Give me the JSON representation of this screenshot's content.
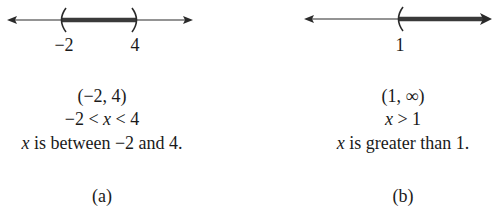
{
  "figures": [
    {
      "id": "a",
      "caption": "(a)",
      "number_line": {
        "type": "bounded-open",
        "left_endpoint": {
          "value": "−2",
          "symbol": "("
        },
        "right_endpoint": {
          "value": "4",
          "symbol": ")"
        },
        "shaded": "between"
      },
      "interval_notation": "(−2, 4)",
      "inequality": {
        "left": "−2 < ",
        "var": "x",
        "right": " < 4"
      },
      "description": {
        "var": "x",
        "text": " is between −2 and 4."
      }
    },
    {
      "id": "b",
      "caption": "(b)",
      "number_line": {
        "type": "unbounded-open",
        "left_endpoint": {
          "value": "1",
          "symbol": "("
        },
        "shaded": "right-to-infinity"
      },
      "interval_notation": "(1, ∞)",
      "inequality": {
        "left": "",
        "var": "x",
        "right": " > 1"
      },
      "description": {
        "var": "x",
        "text": " is greater than 1."
      }
    }
  ],
  "colors": {
    "line": "#2a2a2a",
    "shade": "#3a3a3a",
    "text": "#1a1a1a"
  }
}
